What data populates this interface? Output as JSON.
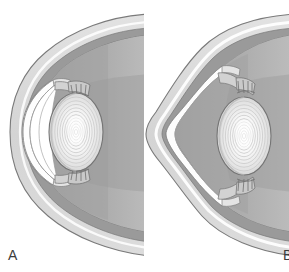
{
  "figure": {
    "type": "medical-illustration",
    "style": "grayscale line-and-tone anatomical drawing",
    "panel_count": 2
  },
  "panels": [
    {
      "id": "A",
      "label": "A",
      "caption": "Normal eye in cross-section",
      "cornea_shape": "regular dome / smooth spherical curvature",
      "structures": [
        "sclera",
        "choroid",
        "retina",
        "cornea",
        "anterior chamber",
        "iris",
        "ciliary body",
        "zonular fibers",
        "crystalline lens",
        "vitreous body"
      ]
    },
    {
      "id": "B",
      "label": "B",
      "caption": "Keratoconus: cone-shaped protrusion and thinning of the cornea",
      "cornea_shape": "conical / apical protrusion (keratoconus)",
      "structures": [
        "sclera",
        "choroid",
        "retina",
        "cone-shaped cornea",
        "deepened anterior chamber",
        "iris",
        "ciliary body",
        "zonular fibers",
        "crystalline lens",
        "vitreous body"
      ]
    }
  ],
  "colors": {
    "background": "#ffffff",
    "sclera_outer": "#d6d6d6",
    "sclera_highlight": "#e9e9e9",
    "choroid_band": "#9e9e9e",
    "retina_band": "#b4b4b4",
    "vitreous": "#a9a9a9",
    "vitreous_light": "#bdbdbd",
    "anterior_chamber": "#ffffff",
    "cornea_fill": "#fbfbfb",
    "lens_fill": "#f2f2f2",
    "lens_core": "#ffffff",
    "lens_rim": "#bcbcbc",
    "iris": "#cfcfcf",
    "ciliary_body": "#c4c4c4",
    "outline": "#6e6e6e",
    "thin_outline": "#8d8d8d",
    "label_text": "#3b3b3b"
  }
}
